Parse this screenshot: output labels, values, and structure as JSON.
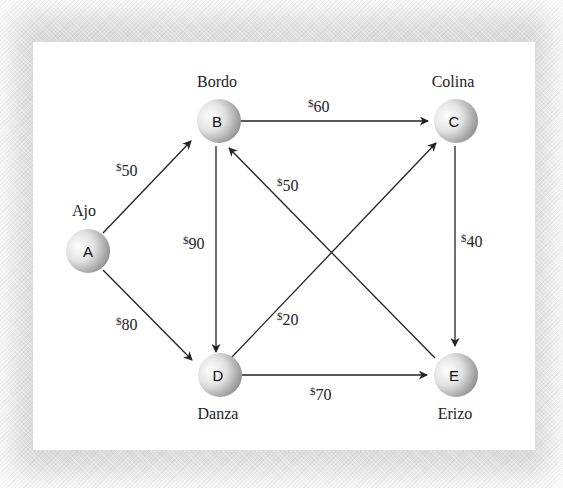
{
  "diagram": {
    "type": "directed-weighted-graph",
    "nodes": [
      {
        "id": "A",
        "label": "A",
        "name": "Ajo"
      },
      {
        "id": "B",
        "label": "B",
        "name": "Bordo"
      },
      {
        "id": "C",
        "label": "C",
        "name": "Colina"
      },
      {
        "id": "D",
        "label": "D",
        "name": "Danza"
      },
      {
        "id": "E",
        "label": "E",
        "name": "Erizo"
      }
    ],
    "edges": [
      {
        "from": "A",
        "to": "B",
        "currency": "$",
        "cost": "50"
      },
      {
        "from": "A",
        "to": "D",
        "currency": "$",
        "cost": "80"
      },
      {
        "from": "B",
        "to": "C",
        "currency": "$",
        "cost": "60"
      },
      {
        "from": "B",
        "to": "D",
        "currency": "$",
        "cost": "90"
      },
      {
        "from": "E",
        "to": "B",
        "currency": "$",
        "cost": "50"
      },
      {
        "from": "D",
        "to": "C",
        "currency": "$",
        "cost": "20"
      },
      {
        "from": "C",
        "to": "E",
        "currency": "$",
        "cost": "40"
      },
      {
        "from": "D",
        "to": "E",
        "currency": "$",
        "cost": "70"
      }
    ]
  },
  "colors": {
    "panel": "#ffffff",
    "border_texture": "#d9d9d9",
    "line": "#222222",
    "node_light": "#ffffff",
    "node_dark": "#8c8c8c"
  }
}
